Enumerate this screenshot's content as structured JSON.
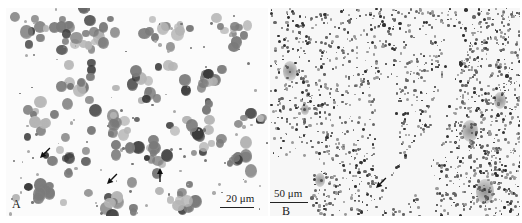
{
  "figure": {
    "panels": [
      {
        "id": "A",
        "label": "A",
        "description": "Cytology smear of stained cells",
        "scale_bar": {
          "text": "20 μm"
        },
        "arrows": [
          {
            "x": 40,
            "y": 158,
            "direction": "down-left"
          },
          {
            "x": 107,
            "y": 184,
            "direction": "down-left"
          },
          {
            "x": 160,
            "y": 168,
            "direction": "up"
          }
        ]
      },
      {
        "id": "B",
        "label": "B",
        "description": "Tissue section with folded epithelium",
        "scale_bar": {
          "text": "50 μm"
        },
        "arrows": [
          {
            "x": 376,
            "y": 188,
            "direction": "down-left"
          }
        ]
      }
    ],
    "colors": {
      "stain_dark": "#3a3a3a",
      "stain_mid": "#7a7a7a",
      "stain_light": "#b5b5b5",
      "background": "#ffffff"
    }
  }
}
